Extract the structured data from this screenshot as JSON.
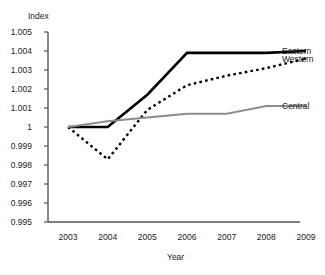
{
  "chart_data": {
    "type": "line",
    "title": "",
    "xlabel": "Year",
    "ylabel": "Index",
    "categories": [
      "2003",
      "2004",
      "2005",
      "2006",
      "2007",
      "2008",
      "2009"
    ],
    "x": [
      2003,
      2004,
      2005,
      2006,
      2007,
      2008,
      2009
    ],
    "xlim": [
      2003,
      2009
    ],
    "ylim": [
      0.995,
      1.005
    ],
    "ytick_labels": [
      "1.005",
      "1.004",
      "1.003",
      "1.002",
      "1.001",
      "1",
      "0.999",
      "0.998",
      "0.997",
      "0.996",
      "0.995"
    ],
    "ytick_values": [
      1.005,
      1.004,
      1.003,
      1.002,
      1.001,
      1.0,
      0.999,
      0.998,
      0.997,
      0.996,
      0.995
    ],
    "grid": false,
    "legend_position": "right",
    "series": [
      {
        "name": "Eastern",
        "values": [
          1.0,
          1.0,
          1.0017,
          1.0039,
          1.0039,
          1.0039,
          1.004
        ],
        "color": "#000000",
        "style": "solid",
        "width": 2.6
      },
      {
        "name": "Western",
        "values": [
          1.0,
          0.9983,
          1.0009,
          1.0022,
          1.0027,
          1.0031,
          1.0036
        ],
        "color": "#000000",
        "style": "dotted",
        "width": 2.4
      },
      {
        "name": "Central",
        "values": [
          1.0,
          1.0003,
          1.0005,
          1.0007,
          1.0007,
          1.0011,
          1.0011
        ],
        "color": "#8c8c8c",
        "style": "solid",
        "width": 2.0
      }
    ],
    "axis_color": "#555555"
  }
}
